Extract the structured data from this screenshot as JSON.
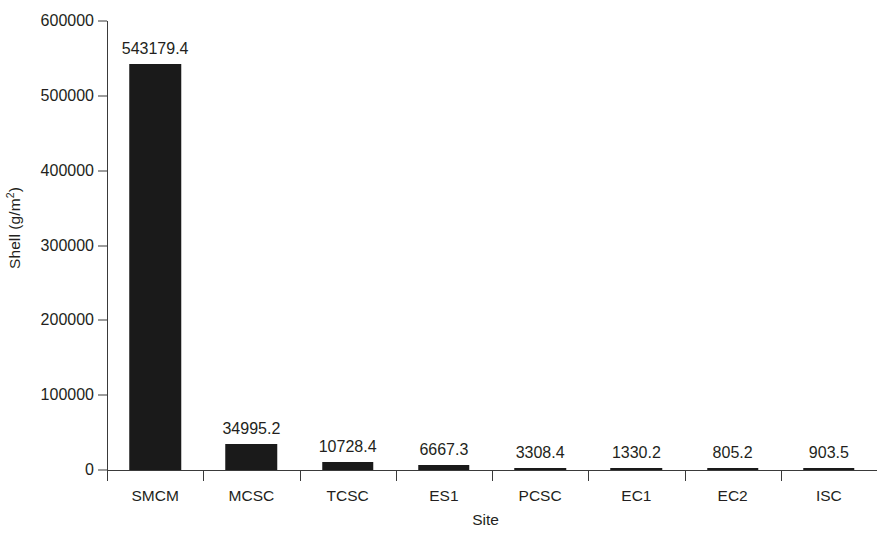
{
  "chart_data": {
    "type": "bar",
    "title": "",
    "xlabel": "Site",
    "ylabel": "Shell (g/m2)",
    "ylabel_base": "Shell (g/m",
    "ylabel_sup": "2",
    "ylabel_tail": ")",
    "categories": [
      "SMCM",
      "MCSC",
      "TCSC",
      "ES1",
      "PCSC",
      "EC1",
      "EC2",
      "ISC"
    ],
    "values": [
      543179.4,
      34995.2,
      10728.4,
      6667.3,
      3308.4,
      1330.2,
      805.2,
      903.5
    ],
    "value_labels": [
      "543179.4",
      "34995.2",
      "10728.4",
      "6667.3",
      "3308.4",
      "1330.2",
      "805.2",
      "903.5"
    ],
    "ylim": [
      0,
      600000
    ],
    "yticks": [
      0,
      100000,
      200000,
      300000,
      400000,
      500000,
      600000
    ],
    "ytick_labels": [
      "0",
      "100000",
      "200000",
      "300000",
      "400000",
      "500000",
      "600000"
    ],
    "grid": false,
    "legend": false,
    "bar_color": "#1a1a1a",
    "axis_color": "#3a3a3a",
    "background_color": "#ffffff",
    "text_color": "#231f20"
  }
}
